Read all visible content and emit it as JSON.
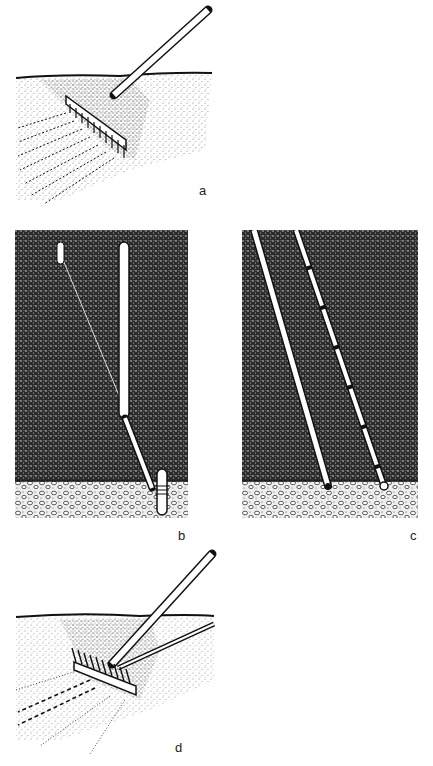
{
  "figure": {
    "panels": [
      {
        "id": "a",
        "label": "a",
        "description": "Rake drawn across soil surface leaving parallel furrows"
      },
      {
        "id": "b",
        "label": "b",
        "description": "Cross-section of soil with vertical rod and angled rod reaching gravel layer"
      },
      {
        "id": "c",
        "label": "c",
        "description": "Cross-section of soil with two slanted rods reaching gravel layer"
      },
      {
        "id": "d",
        "label": "d",
        "description": "Rake with attached angled rod drawn across soil surface"
      }
    ],
    "colors": {
      "ink": "#111111",
      "soil_dark": "#2a2a2a",
      "gravel_bg": "#e9e9e9",
      "paper": "#ffffff"
    }
  }
}
